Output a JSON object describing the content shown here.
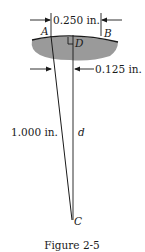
{
  "figure": {
    "caption": "Figure 2-5",
    "labels": {
      "point_a": "A",
      "point_b": "B",
      "point_c": "C",
      "point_d": "D",
      "segment_d": "d"
    },
    "dimensions": {
      "chord_ab": "0.250 in.",
      "half_chord": "0.125 in.",
      "radius_ac": "1.000 in."
    },
    "colors": {
      "ink": "#1a1a1a",
      "surface_fill": "#9a9a9a"
    }
  }
}
